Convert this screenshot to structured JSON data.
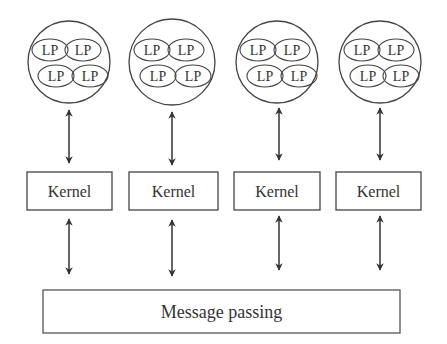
{
  "diagram": {
    "processes": [
      {
        "lps": [
          "LP",
          "LP",
          "LP",
          "LP"
        ],
        "kernel": "Kernel"
      },
      {
        "lps": [
          "LP",
          "LP",
          "LP",
          "LP"
        ],
        "kernel": "Kernel"
      },
      {
        "lps": [
          "LP",
          "LP",
          "LP",
          "LP"
        ],
        "kernel": "Kernel"
      },
      {
        "lps": [
          "LP",
          "LP",
          "LP",
          "LP"
        ],
        "kernel": "Kernel"
      }
    ],
    "message_passing": "Message passing",
    "colors": {
      "stroke": "#444444",
      "text": "#333333",
      "background": "#ffffff"
    }
  }
}
